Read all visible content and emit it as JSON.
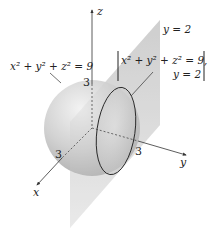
{
  "figure": {
    "type": "3d-surface-intersection-diagram",
    "sphere": {
      "equation_label": "x² + y² + z² = 9",
      "radius": 3
    },
    "plane": {
      "equation_label": "y = 2"
    },
    "intersection": {
      "line1": "x² + y² + z² = 9,",
      "line2": "y = 2"
    },
    "axes": {
      "x": "x",
      "y": "y",
      "z": "z"
    },
    "ticks": {
      "z": "3",
      "x": "3",
      "y": "3"
    },
    "colors": {
      "sphere_fill": "#c8c8c8",
      "plane_fill": "#d9d9d9",
      "axis": "#333333",
      "circle_stroke": "#222222"
    }
  }
}
